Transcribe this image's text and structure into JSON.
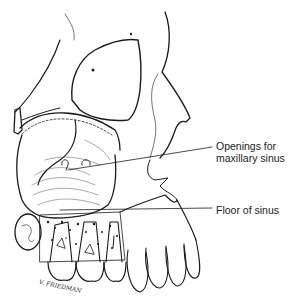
{
  "figure": {
    "labels": [
      {
        "id": "openings",
        "line1": "Openings for",
        "line2": "maxillary sinus"
      },
      {
        "id": "floor",
        "text": "Floor of sinus"
      }
    ],
    "signature": "V. FRIEDMAN",
    "colors": {
      "ink": "#1a1a1a",
      "background": "#ffffff",
      "label_text": "#222222"
    }
  }
}
